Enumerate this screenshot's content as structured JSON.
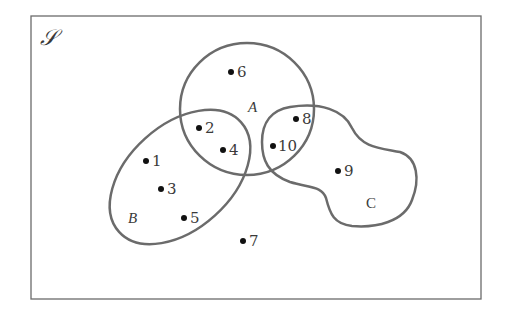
{
  "diagram": {
    "type": "venn",
    "universe": {
      "label": "𝒮",
      "elements": [
        "1",
        "2",
        "3",
        "4",
        "5",
        "6",
        "7",
        "8",
        "9",
        "10"
      ]
    },
    "sets": [
      {
        "name": "A",
        "label": "A",
        "elements": [
          "2",
          "4",
          "6",
          "8",
          "10"
        ]
      },
      {
        "name": "B",
        "label": "B",
        "elements": [
          "1",
          "2",
          "3",
          "4",
          "5"
        ]
      },
      {
        "name": "C",
        "label": "C",
        "elements": [
          "8",
          "9",
          "10"
        ]
      }
    ],
    "points": [
      {
        "id": "1",
        "label": "1"
      },
      {
        "id": "2",
        "label": "2"
      },
      {
        "id": "3",
        "label": "3"
      },
      {
        "id": "4",
        "label": "4"
      },
      {
        "id": "5",
        "label": "5"
      },
      {
        "id": "6",
        "label": "6"
      },
      {
        "id": "7",
        "label": "7"
      },
      {
        "id": "8",
        "label": "8"
      },
      {
        "id": "9",
        "label": "9"
      },
      {
        "id": "10",
        "label": "10"
      }
    ],
    "colors": {
      "outline": "#6b6b6b",
      "dot": "#111111",
      "text": "#3a3a3a"
    }
  }
}
